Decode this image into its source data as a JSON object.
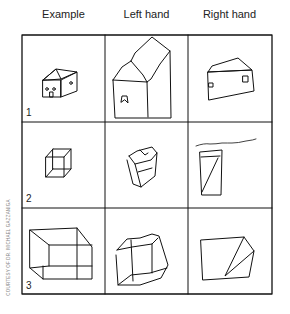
{
  "columns": [
    "Example",
    "Left hand",
    "Right hand"
  ],
  "rows": [
    {
      "number": "1",
      "subject": "house"
    },
    {
      "number": "2",
      "subject": "cube"
    },
    {
      "number": "3",
      "subject": "box"
    }
  ],
  "annotation": "Right hand (handwritten)",
  "credit": "COURTESY OF DR. MICHAEL GAZZANIGA"
}
